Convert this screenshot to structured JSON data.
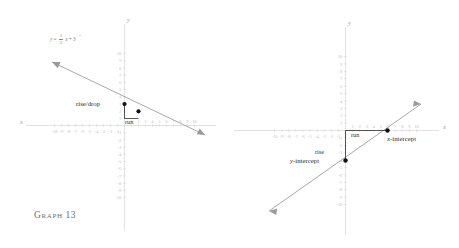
{
  "page": {
    "width": 459,
    "height": 248,
    "background": "#ffffff",
    "axis_color": "#d2d2d2",
    "tick_label_color": "#c2c2c2",
    "line_color": "#9a9a9a",
    "point_color": "#111111",
    "annotation_color": "#2e2e2e",
    "title_color": "#6d6d6d"
  },
  "graphs": [
    {
      "id": "graph-13",
      "title": "Graph 13",
      "axis_labels": {
        "x": "x",
        "y": "y"
      },
      "x_ticks": [
        -10,
        -9,
        -8,
        -7,
        -6,
        -5,
        -4,
        -3,
        -2,
        -1,
        1,
        2,
        3,
        4,
        5,
        6,
        7,
        8,
        9,
        10
      ],
      "y_ticks": [
        10,
        9,
        8,
        7,
        6,
        5,
        4,
        3,
        2,
        1,
        -1,
        -2,
        -3,
        -4,
        -5,
        -6,
        -7,
        -8,
        -9,
        -10
      ],
      "x_range": [
        -10,
        10
      ],
      "y_range": [
        -10,
        10
      ],
      "equation": {
        "lhs": "y",
        "eq": "=",
        "sign": "-",
        "num": "1",
        "den": "2",
        "var": "x",
        "plus": "+",
        "const": "3",
        "full": "y = -1/2 x + 3"
      },
      "line": {
        "slope": -0.5,
        "intercept": 3,
        "arrows": "both"
      },
      "points": [
        {
          "label": "(0, 3)",
          "x": 0,
          "y": 3
        },
        {
          "label": "(2, 2)",
          "x": 2,
          "y": 2
        }
      ],
      "annotations": [
        {
          "name": "rise-drop",
          "text": "rise/drop"
        },
        {
          "name": "run",
          "text": "run"
        }
      ]
    },
    {
      "id": "graph-14",
      "title": "Graph 14",
      "axis_labels": {
        "x": "x",
        "y": "y"
      },
      "x_ticks": [
        -10,
        -9,
        -8,
        -7,
        -6,
        -5,
        -4,
        -3,
        -2,
        -1,
        1,
        2,
        3,
        4,
        5,
        6,
        7,
        8,
        9,
        10
      ],
      "y_ticks": [
        10,
        9,
        8,
        7,
        6,
        5,
        4,
        3,
        2,
        1,
        -1,
        -2,
        -3,
        -4,
        -5,
        -6,
        -7,
        -8,
        -9,
        -10
      ],
      "x_range": [
        -10,
        10
      ],
      "y_range": [
        -10,
        10
      ],
      "line": {
        "slope": 0.6667,
        "intercept": -4,
        "arrows": "both"
      },
      "points": [
        {
          "label": "(0, -4)",
          "x": 0,
          "y": -4
        },
        {
          "label": "(6, 0)",
          "x": 6,
          "y": 0
        }
      ],
      "annotations": [
        {
          "name": "rise",
          "text": "rise"
        },
        {
          "name": "run",
          "text": "run"
        },
        {
          "name": "x-intercept",
          "prefix": "x",
          "suffix": "-intercept",
          "text": "x-intercept"
        },
        {
          "name": "y-intercept",
          "prefix": "y",
          "suffix": "-intercept",
          "text": "y-intercept"
        }
      ]
    }
  ],
  "chart_data": {
    "type": "line",
    "panels": [
      {
        "name": "Graph 13",
        "xlabel": "x",
        "ylabel": "y",
        "xlim": [
          -10,
          10
        ],
        "ylim": [
          -10,
          10
        ],
        "grid": false,
        "series": [
          {
            "name": "y = -1/2 x + 3",
            "slope": -0.5,
            "intercept": 3,
            "x": [
              -10,
              10
            ],
            "values": [
              8,
              -2
            ],
            "marked_points": [
              [
                0,
                3
              ],
              [
                2,
                2
              ]
            ],
            "annotations": [
              "rise/drop",
              "run"
            ]
          }
        ]
      },
      {
        "name": "Graph 14",
        "xlabel": "x",
        "ylabel": "y",
        "xlim": [
          -10,
          10
        ],
        "ylim": [
          -10,
          10
        ],
        "grid": false,
        "series": [
          {
            "name": "line through (0,-4) and (6,0)",
            "slope": 0.6667,
            "intercept": -4,
            "x": [
              -10,
              10
            ],
            "values": [
              -10.67,
              2.67
            ],
            "marked_points": [
              [
                0,
                -4
              ],
              [
                6,
                0
              ]
            ],
            "annotations": [
              "rise",
              "run",
              "x-intercept",
              "y-intercept"
            ]
          }
        ]
      }
    ]
  }
}
